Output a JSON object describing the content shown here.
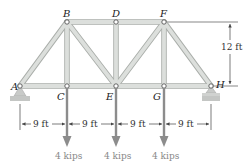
{
  "figure": {
    "type": "truss",
    "colors": {
      "member_fill": "#d9dcd9",
      "member_edge": "#a9ada9",
      "support_fill": "#c8cac8",
      "load_arrow": "#8c8c8c",
      "dimension_line": "#444444",
      "joint": "#ffffff"
    },
    "joints": [
      {
        "id": "A",
        "label": "A",
        "x": 20,
        "y": 86
      },
      {
        "id": "B",
        "label": "B",
        "x": 67,
        "y": 22
      },
      {
        "id": "C",
        "label": "C",
        "x": 67,
        "y": 86
      },
      {
        "id": "D",
        "label": "D",
        "x": 116,
        "y": 22
      },
      {
        "id": "E",
        "label": "E",
        "x": 116,
        "y": 86
      },
      {
        "id": "F",
        "label": "F",
        "x": 164,
        "y": 22
      },
      {
        "id": "G",
        "label": "G",
        "x": 164,
        "y": 86
      },
      {
        "id": "H",
        "label": "H",
        "x": 211,
        "y": 86
      }
    ],
    "members": [
      [
        "A",
        "B"
      ],
      [
        "A",
        "C"
      ],
      [
        "B",
        "C"
      ],
      [
        "B",
        "D"
      ],
      [
        "B",
        "E"
      ],
      [
        "C",
        "E"
      ],
      [
        "D",
        "E"
      ],
      [
        "D",
        "F"
      ],
      [
        "E",
        "F"
      ],
      [
        "E",
        "G"
      ],
      [
        "F",
        "G"
      ],
      [
        "F",
        "H"
      ],
      [
        "G",
        "H"
      ]
    ],
    "supports": [
      {
        "joint": "A",
        "type": "pin"
      },
      {
        "joint": "H",
        "type": "roller"
      }
    ],
    "loads": [
      {
        "joint": "C",
        "label": "4 kips"
      },
      {
        "joint": "E",
        "label": "4 kips"
      },
      {
        "joint": "G",
        "label": "4 kips"
      }
    ],
    "dimensions": {
      "horizontal": [
        "9 ft",
        "9 ft",
        "9 ft",
        "9 ft"
      ],
      "vertical": "12 ft"
    }
  }
}
